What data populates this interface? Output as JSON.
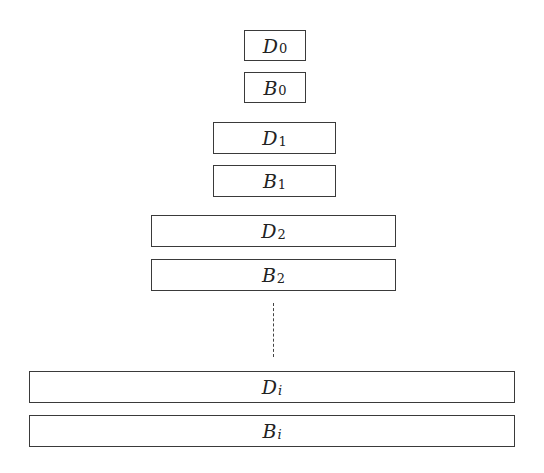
{
  "diagram": {
    "blocks": [
      {
        "id": "D0",
        "var": "D",
        "sub": "0",
        "sub_italic": false,
        "x": 244,
        "y": 30,
        "w": 62,
        "h": 31
      },
      {
        "id": "B0",
        "var": "B",
        "sub": "0",
        "sub_italic": false,
        "x": 244,
        "y": 72,
        "w": 62,
        "h": 31
      },
      {
        "id": "D1",
        "var": "D",
        "sub": "1",
        "sub_italic": false,
        "x": 213,
        "y": 122,
        "w": 123,
        "h": 32
      },
      {
        "id": "B1",
        "var": "B",
        "sub": "1",
        "sub_italic": false,
        "x": 213,
        "y": 165,
        "w": 123,
        "h": 32
      },
      {
        "id": "D2",
        "var": "D",
        "sub": "2",
        "sub_italic": false,
        "x": 151,
        "y": 215,
        "w": 245,
        "h": 32
      },
      {
        "id": "B2",
        "var": "B",
        "sub": "2",
        "sub_italic": false,
        "x": 151,
        "y": 259,
        "w": 245,
        "h": 32
      },
      {
        "id": "Di",
        "var": "D",
        "sub": "i",
        "sub_italic": true,
        "x": 29,
        "y": 371,
        "w": 486,
        "h": 32
      },
      {
        "id": "Bi",
        "var": "B",
        "sub": "i",
        "sub_italic": true,
        "x": 29,
        "y": 415,
        "w": 486,
        "h": 32
      }
    ],
    "continuation": {
      "style": "dashed-vertical-line",
      "x": 273,
      "y1": 303,
      "y2": 357
    }
  }
}
